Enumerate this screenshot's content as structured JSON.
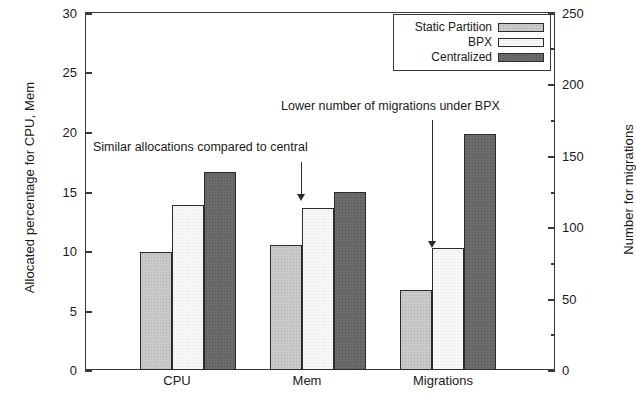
{
  "chart_data": {
    "type": "bar",
    "title": "",
    "subtitle": "",
    "categories": [
      "CPU",
      "Mem",
      "Migrations"
    ],
    "series": [
      {
        "name": "Static Partition",
        "color": "#c9c9c9",
        "values": [
          9.9,
          10.5,
          6.7
        ]
      },
      {
        "name": "BPX",
        "color": "#f7f7f5",
        "values": [
          13.8,
          13.6,
          10.2
        ]
      },
      {
        "name": "Centralized",
        "color": "#6b6b6b",
        "values": [
          16.6,
          14.9,
          19.8
        ]
      }
    ],
    "xlabel": "",
    "ylabel": "Allocated percentage for CPU, Mem",
    "ylabel_right": "Number for migrations",
    "ylim": [
      0,
      30
    ],
    "ylim_right": [
      0,
      250
    ],
    "yticks": [
      0,
      5,
      10,
      15,
      20,
      25,
      30
    ],
    "yticks_right": [
      0,
      50,
      100,
      150,
      200,
      250
    ],
    "grid": false,
    "legend_position": "top-right",
    "annotations": [
      {
        "text": "Similar allocations compared to central",
        "target": "Mem BPX bar"
      },
      {
        "text": "Lower number of migrations under BPX",
        "target": "Migrations BPX bar"
      }
    ]
  },
  "axes": {
    "left": {
      "title": "Allocated percentage for CPU, Mem",
      "ticks": [
        "0",
        "5",
        "10",
        "15",
        "20",
        "25",
        "30"
      ]
    },
    "right": {
      "title": "Number for migrations",
      "ticks": [
        "0",
        "50",
        "100",
        "150",
        "200",
        "250"
      ]
    },
    "x": {
      "ticks": [
        "CPU",
        "Mem",
        "Migrations"
      ]
    }
  },
  "legend": {
    "items": [
      {
        "label": "Static Partition",
        "swatch": "static-partition-swatch"
      },
      {
        "label": "BPX",
        "swatch": "bpx-swatch"
      },
      {
        "label": "Centralized",
        "swatch": "centralized-swatch"
      }
    ]
  },
  "annotations": {
    "first": "Similar allocations compared to central",
    "second": "Lower number of migrations under BPX"
  }
}
